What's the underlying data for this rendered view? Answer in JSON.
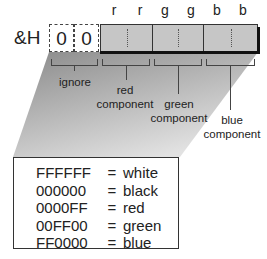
{
  "diagram": {
    "prefix": "&H",
    "ignored_digits": [
      "0",
      "0"
    ],
    "column_letters": [
      "r",
      "r",
      "g",
      "g",
      "b",
      "b"
    ],
    "component_labels": {
      "ignore": "ignore",
      "red": [
        "red",
        "component"
      ],
      "green": [
        "green",
        "component"
      ],
      "blue": [
        "blue",
        "component"
      ]
    },
    "colors": {
      "component_fill": "#c6c6c6",
      "shadow": "#111111"
    }
  },
  "legend": {
    "rows": [
      {
        "code": "FFFFFF",
        "eq": "=",
        "name": "white"
      },
      {
        "code": "000000",
        "eq": "=",
        "name": "black"
      },
      {
        "code": "0000FF",
        "eq": "=",
        "name": "red"
      },
      {
        "code": "00FF00",
        "eq": "=",
        "name": "green"
      },
      {
        "code": "FF0000",
        "eq": "=",
        "name": "blue"
      }
    ]
  }
}
